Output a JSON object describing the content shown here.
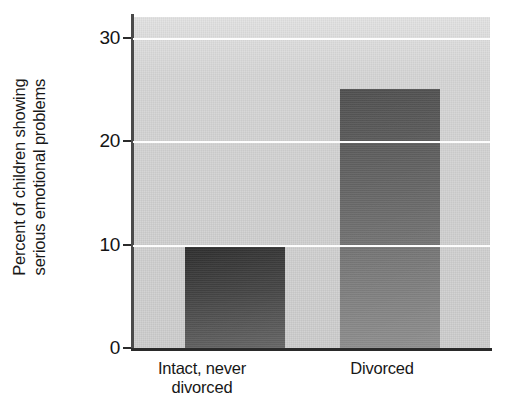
{
  "chart_data": {
    "type": "bar",
    "title": "",
    "subtitle": "",
    "xlabel": "",
    "ylabel": "Percent of children showing serious emotional problems",
    "ylabel_lines": [
      "Percent of children showing",
      "serious emotional problems"
    ],
    "categories": [
      "Intact, never divorced",
      "Divorced"
    ],
    "category_label_lines": [
      [
        "Intact, never",
        "divorced"
      ],
      [
        "Divorced"
      ]
    ],
    "values": [
      10,
      25
    ],
    "ylim": [
      0,
      32
    ],
    "yticks": [
      0,
      10,
      20,
      30
    ],
    "ytick_labels": [
      "0",
      "10",
      "20",
      "30"
    ],
    "gridlines": [
      10,
      20,
      30
    ],
    "grid": true,
    "grid_color": "#fdfdfd",
    "legend": "none",
    "bar_colors": [
      "#343434",
      "#5d5d5d"
    ],
    "plot_background": "#d2d2d2",
    "axis_color": "#2a2a2a"
  }
}
